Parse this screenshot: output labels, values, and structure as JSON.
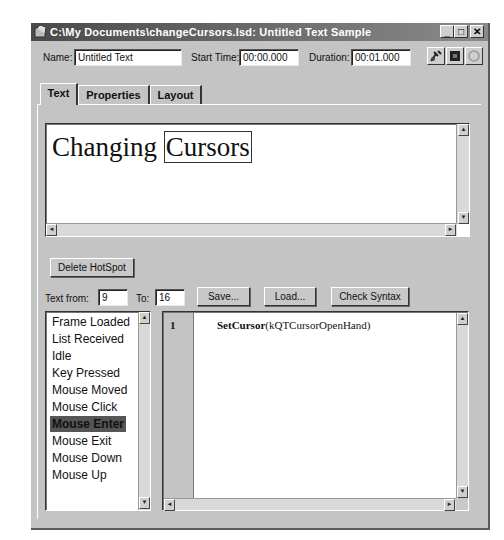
{
  "window": {
    "title": "C:\\My Documents\\changeCursors.lsd: Untitled Text Sample",
    "controls": {
      "minimize": "_",
      "maximize": "□",
      "close": "✕"
    }
  },
  "header": {
    "name_label": "Name:",
    "name_value": "Untitled Text",
    "start_time_label": "Start Time:",
    "start_time_value": "00:00.000",
    "duration_label": "Duration:",
    "duration_value": "00:01.000",
    "tool_icons": [
      "hotspot-pointer-icon",
      "stop-icon",
      "refresh-icon"
    ]
  },
  "tabs": [
    {
      "label": "Text",
      "active": true
    },
    {
      "label": "Properties",
      "active": false
    },
    {
      "label": "Layout",
      "active": false
    }
  ],
  "text_editor": {
    "text_before": "Changing ",
    "hotspot_text": "Cursors"
  },
  "controls": {
    "delete_hotspot": "Delete HotSpot",
    "text_from_label": "Text from:",
    "text_from_value": "9",
    "to_label": "To:",
    "to_value": "16",
    "save": "Save...",
    "load": "Load...",
    "check_syntax": "Check Syntax"
  },
  "events": {
    "items": [
      "Frame Loaded",
      "List Received",
      "Idle",
      "Key Pressed",
      "Mouse Moved",
      "Mouse Click",
      "Mouse Enter",
      "Mouse Exit",
      "Mouse Down",
      "Mouse Up"
    ],
    "selected_index": 6
  },
  "script": {
    "lines": [
      {
        "number": "1",
        "keyword": "SetCursor",
        "args": "(kQTCursorOpenHand)"
      }
    ]
  },
  "scroll_arrows": {
    "up": "▲",
    "down": "▼",
    "left": "◄",
    "right": "►"
  }
}
